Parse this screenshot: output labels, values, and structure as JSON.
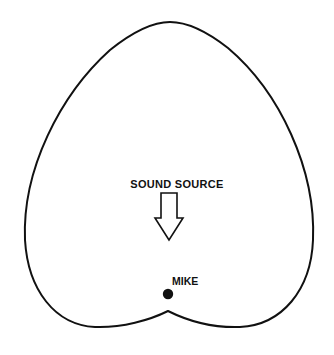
{
  "diagram": {
    "pattern_type": "cardioid",
    "labels": {
      "source": "SOUND SOURCE",
      "mic": "MIKE"
    },
    "colors": {
      "line": "#111111",
      "background": "#ffffff"
    },
    "elements": [
      {
        "name": "polar-pattern-outline",
        "shape": "cardioid"
      },
      {
        "name": "sound-direction-arrow",
        "direction": "down"
      },
      {
        "name": "microphone-dot",
        "shape": "filled-circle"
      }
    ]
  }
}
